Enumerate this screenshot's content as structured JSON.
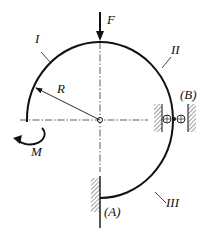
{
  "diagram": {
    "force_label": "F",
    "moment_label": "M",
    "radius_label": "R",
    "segments": [
      "I",
      "II",
      "III"
    ],
    "supports": [
      "(A)",
      "(B)"
    ]
  }
}
